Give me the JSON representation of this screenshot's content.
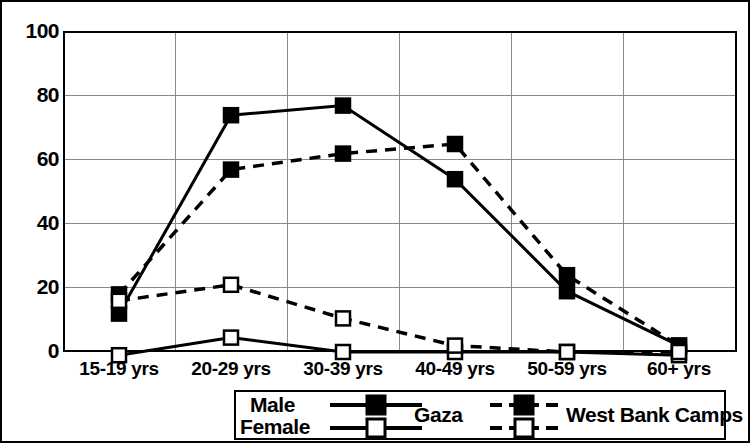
{
  "chart_data": {
    "type": "line",
    "title": "",
    "xlabel": "",
    "ylabel": "",
    "categories": [
      "15-19 yrs",
      "20-29 yrs",
      "30-39 yrs",
      "40-49 yrs",
      "50-59 yrs",
      "60+ yrs"
    ],
    "yticks": [
      0,
      20,
      40,
      60,
      80,
      100
    ],
    "ylim": [
      -4,
      100
    ],
    "grid": true,
    "legend_position": "bottom",
    "legend_row_labels": [
      "Male",
      "Female"
    ],
    "legend_col_labels": [
      "Gaza",
      "West Bank Camps"
    ],
    "series": [
      {
        "name": "Gaza Male",
        "group": "Gaza",
        "sex": "Male",
        "line": "solid",
        "marker": "filled-square",
        "values": [
          12,
          74,
          77,
          54,
          19,
          2
        ]
      },
      {
        "name": "West Bank Camps Male",
        "group": "West Bank Camps",
        "sex": "Male",
        "line": "dashed",
        "marker": "filled-square",
        "values": [
          18,
          57,
          62,
          65,
          24,
          2
        ]
      },
      {
        "name": "Gaza Female",
        "group": "Gaza",
        "sex": "Female",
        "line": "solid",
        "marker": "open-square",
        "values": [
          -1,
          4.5,
          0,
          0,
          0,
          -1
        ]
      },
      {
        "name": "West Bank Camps Female",
        "group": "West Bank Camps",
        "sex": "Female",
        "line": "dashed",
        "marker": "open-square",
        "values": [
          16,
          21,
          10.5,
          2,
          0,
          0
        ]
      }
    ],
    "colors": {
      "line": "#000000",
      "grid": "#8a8a8a",
      "background": "#ffffff",
      "marker_fill": "#000000",
      "marker_open": "#ffffff"
    }
  },
  "axis": {
    "y_tick_labels": [
      "100",
      "80",
      "60",
      "40",
      "20",
      "0"
    ],
    "x_tick_labels": [
      "15-19 yrs",
      "20-29 yrs",
      "30-39 yrs",
      "40-49 yrs",
      "50-59 yrs",
      "60+ yrs"
    ]
  },
  "legend": {
    "male_label": "Male",
    "female_label": "Female",
    "gaza_label": "Gaza",
    "west_bank_label": "West Bank Camps"
  }
}
